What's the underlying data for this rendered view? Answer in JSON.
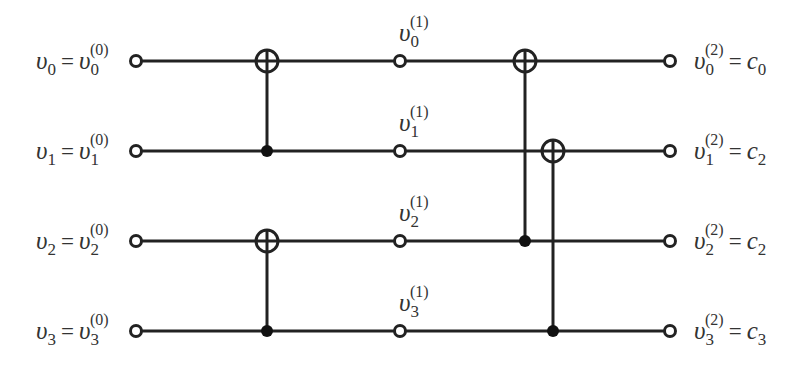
{
  "diagram": {
    "type": "butterfly-xor-network",
    "colors": {
      "stroke": "#222222",
      "text": "#333333",
      "background": "#ffffff"
    },
    "wires": [
      {
        "index": 0,
        "y": 61,
        "input_label": {
          "lhs": "υ",
          "lhs_sub": "0",
          "rhs": "υ",
          "rhs_sub": "0",
          "rhs_sup": "(0)"
        },
        "mid_label": {
          "var": "υ",
          "sub": "0",
          "sup": "(1)"
        },
        "output_label": {
          "var": "υ",
          "sub": "0",
          "sup": "(2)",
          "eq": "=",
          "rhs": "c",
          "rhs_sub": "0"
        }
      },
      {
        "index": 1,
        "y": 151,
        "input_label": {
          "lhs": "υ",
          "lhs_sub": "1",
          "rhs": "υ",
          "rhs_sub": "1",
          "rhs_sup": "(0)"
        },
        "mid_label": {
          "var": "υ",
          "sub": "1",
          "sup": "(1)"
        },
        "output_label": {
          "var": "υ",
          "sub": "1",
          "sup": "(2)",
          "eq": "=",
          "rhs": "c",
          "rhs_sub": "2"
        }
      },
      {
        "index": 2,
        "y": 241,
        "input_label": {
          "lhs": "υ",
          "lhs_sub": "2",
          "rhs": "υ",
          "rhs_sub": "2",
          "rhs_sup": "(0)"
        },
        "mid_label": {
          "var": "υ",
          "sub": "2",
          "sup": "(1)"
        },
        "output_label": {
          "var": "υ",
          "sub": "2",
          "sup": "(2)",
          "eq": "=",
          "rhs": "c",
          "rhs_sub": "2"
        }
      },
      {
        "index": 3,
        "y": 331,
        "input_label": {
          "lhs": "υ",
          "lhs_sub": "3",
          "rhs": "υ",
          "rhs_sub": "3",
          "rhs_sup": "(0)"
        },
        "mid_label": {
          "var": "υ",
          "sub": "3",
          "sup": "(1)"
        },
        "output_label": {
          "var": "υ",
          "sub": "3",
          "sup": "(2)",
          "eq": "=",
          "rhs": "c",
          "rhs_sub": "3"
        }
      }
    ],
    "node_columns": {
      "input_x": 136,
      "mid_x": 400,
      "output_x": 670
    },
    "gates": [
      {
        "stage": 1,
        "x": 267,
        "target_wire": 0,
        "control_wire": 1
      },
      {
        "stage": 1,
        "x": 267,
        "target_wire": 2,
        "control_wire": 3
      },
      {
        "stage": 2,
        "x": 525,
        "target_wire": 0,
        "control_wire": 2
      },
      {
        "stage": 2,
        "x": 553,
        "target_wire": 1,
        "control_wire": 3
      }
    ],
    "eq_sign": "="
  }
}
